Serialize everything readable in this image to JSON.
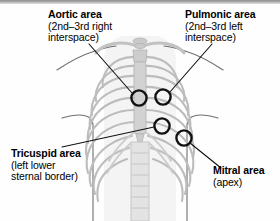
{
  "figure": {
    "background_color": "#fefefe",
    "border_color": "#8d8d8d"
  },
  "illustration": {
    "name": "rib-cage-thorax",
    "bone_fill": "#d7d7d7",
    "bone_stroke": "#b4b4b4",
    "sternum_fill": "#cfcfcf",
    "body_outline_color": "#6e6e6e",
    "torso_fill": "#efefef"
  },
  "markers": {
    "stroke_color": "#111111",
    "fill": "none",
    "stroke_width": 2.4,
    "radius": 7.6,
    "items": [
      {
        "id": "aortic",
        "name": "aortic-area-marker",
        "cx": 139,
        "cy": 98
      },
      {
        "id": "pulmonic",
        "name": "pulmonic-area-marker",
        "cx": 163,
        "cy": 97
      },
      {
        "id": "tricuspid",
        "name": "tricuspid-area-marker",
        "cx": 162,
        "cy": 126
      },
      {
        "id": "mitral",
        "name": "mitral-area-marker",
        "cx": 184,
        "cy": 138
      }
    ]
  },
  "leaders": {
    "color": "#111111",
    "width": 1.1,
    "lines": [
      {
        "for": "aortic",
        "x1": 89,
        "y1": 44,
        "x2": 132,
        "y2": 93
      },
      {
        "for": "pulmonic",
        "x1": 212,
        "y1": 44,
        "x2": 170,
        "y2": 92
      },
      {
        "for": "tricuspid",
        "x1": 62,
        "y1": 147,
        "x2": 154,
        "y2": 127
      },
      {
        "for": "mitral",
        "x1": 221,
        "y1": 168,
        "x2": 190,
        "y2": 143
      }
    ]
  },
  "labels": {
    "aortic": {
      "title": "Aortic area",
      "sub_line1": "(2nd–3rd right",
      "sub_line2": "interspace)"
    },
    "pulmonic": {
      "title": "Pulmonic area",
      "sub_line1": "(2nd–3rd left",
      "sub_line2": "interspace)"
    },
    "tricuspid": {
      "title": "Tricuspid area",
      "sub_line1": "(left lower",
      "sub_line2": "sternal border)"
    },
    "mitral": {
      "title": "Mitral area",
      "sub_line1": "(apex)",
      "sub_line2": ""
    }
  }
}
